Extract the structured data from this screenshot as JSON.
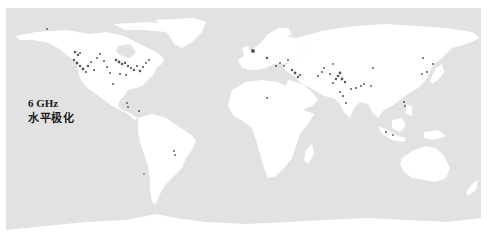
{
  "map": {
    "projection": "equirectangular",
    "ocean_color": "#e2e2e2",
    "land_color": "#ffffff",
    "point_color": "#3a3a3a",
    "label": {
      "frequency": "6 GHz",
      "polarization": "水平极化"
    },
    "rfi_points": [
      {
        "region": "north-america",
        "x": 75,
        "y": 52,
        "r": 1.3
      },
      {
        "region": "north-america",
        "x": 78,
        "y": 55,
        "r": 1.2
      },
      {
        "region": "north-america",
        "x": 80,
        "y": 53,
        "r": 1.1
      },
      {
        "region": "north-america",
        "x": 74,
        "y": 60,
        "r": 1.2
      },
      {
        "region": "north-america",
        "x": 77,
        "y": 63,
        "r": 1.4
      },
      {
        "region": "north-america",
        "x": 80,
        "y": 66,
        "r": 1.2
      },
      {
        "region": "north-america",
        "x": 83,
        "y": 69,
        "r": 1.4
      },
      {
        "region": "north-america",
        "x": 86,
        "y": 72,
        "r": 1.1
      },
      {
        "region": "north-america",
        "x": 88,
        "y": 66,
        "r": 1.2
      },
      {
        "region": "north-america",
        "x": 91,
        "y": 62,
        "r": 1.0
      },
      {
        "region": "north-america",
        "x": 94,
        "y": 70,
        "r": 1.1
      },
      {
        "region": "north-america",
        "x": 97,
        "y": 58,
        "r": 1.0
      },
      {
        "region": "north-america",
        "x": 100,
        "y": 54,
        "r": 1.1
      },
      {
        "region": "north-america",
        "x": 104,
        "y": 61,
        "r": 1.0
      },
      {
        "region": "north-america",
        "x": 107,
        "y": 67,
        "r": 1.0
      },
      {
        "region": "north-america",
        "x": 110,
        "y": 73,
        "r": 1.0
      },
      {
        "region": "north-america",
        "x": 113,
        "y": 84,
        "r": 1.0
      },
      {
        "region": "north-america",
        "x": 116,
        "y": 60,
        "r": 1.3
      },
      {
        "region": "north-america",
        "x": 119,
        "y": 62,
        "r": 1.4
      },
      {
        "region": "north-america",
        "x": 122,
        "y": 64,
        "r": 1.3
      },
      {
        "region": "north-america",
        "x": 125,
        "y": 63,
        "r": 1.2
      },
      {
        "region": "north-america",
        "x": 128,
        "y": 66,
        "r": 1.2
      },
      {
        "region": "north-america",
        "x": 131,
        "y": 68,
        "r": 1.1
      },
      {
        "region": "north-america",
        "x": 134,
        "y": 70,
        "r": 1.2
      },
      {
        "region": "north-america",
        "x": 137,
        "y": 66,
        "r": 1.1
      },
      {
        "region": "north-america",
        "x": 140,
        "y": 71,
        "r": 1.3
      },
      {
        "region": "north-america",
        "x": 143,
        "y": 67,
        "r": 1.1
      },
      {
        "region": "north-america",
        "x": 146,
        "y": 63,
        "r": 1.0
      },
      {
        "region": "north-america",
        "x": 149,
        "y": 60,
        "r": 1.0
      },
      {
        "region": "north-america",
        "x": 120,
        "y": 74,
        "r": 1.0
      },
      {
        "region": "north-america",
        "x": 126,
        "y": 75,
        "r": 1.0
      },
      {
        "region": "north-america",
        "x": 47,
        "y": 29,
        "r": 0.9
      },
      {
        "region": "central-america",
        "x": 127,
        "y": 103,
        "r": 0.9
      },
      {
        "region": "central-america",
        "x": 128,
        "y": 107,
        "r": 0.9
      },
      {
        "region": "south-america",
        "x": 139,
        "y": 111,
        "r": 1.0
      },
      {
        "region": "south-america",
        "x": 174,
        "y": 151,
        "r": 0.9
      },
      {
        "region": "south-america",
        "x": 175,
        "y": 155,
        "r": 0.9
      },
      {
        "region": "south-america",
        "x": 144,
        "y": 174,
        "r": 0.8
      },
      {
        "region": "europe",
        "x": 253,
        "y": 51,
        "r": 2.0
      },
      {
        "region": "europe",
        "x": 267,
        "y": 58,
        "r": 1.2
      },
      {
        "region": "middle-east",
        "x": 276,
        "y": 66,
        "r": 1.0
      },
      {
        "region": "middle-east",
        "x": 280,
        "y": 63,
        "r": 1.0
      },
      {
        "region": "middle-east",
        "x": 284,
        "y": 66,
        "r": 0.9
      },
      {
        "region": "middle-east",
        "x": 288,
        "y": 60,
        "r": 0.9
      },
      {
        "region": "middle-east",
        "x": 292,
        "y": 70,
        "r": 1.2
      },
      {
        "region": "middle-east",
        "x": 295,
        "y": 73,
        "r": 1.4
      },
      {
        "region": "middle-east",
        "x": 298,
        "y": 77,
        "r": 1.2
      },
      {
        "region": "middle-east",
        "x": 300,
        "y": 75,
        "r": 1.1
      },
      {
        "region": "africa",
        "x": 267,
        "y": 98,
        "r": 1.0
      },
      {
        "region": "south-asia",
        "x": 318,
        "y": 76,
        "r": 1.0
      },
      {
        "region": "south-asia",
        "x": 322,
        "y": 72,
        "r": 1.0
      },
      {
        "region": "south-asia",
        "x": 324,
        "y": 68,
        "r": 1.0
      },
      {
        "region": "south-asia",
        "x": 330,
        "y": 74,
        "r": 1.0
      },
      {
        "region": "south-asia",
        "x": 333,
        "y": 64,
        "r": 0.9
      },
      {
        "region": "south-asia",
        "x": 336,
        "y": 79,
        "r": 1.2
      },
      {
        "region": "south-asia",
        "x": 338,
        "y": 76,
        "r": 1.3
      },
      {
        "region": "south-asia",
        "x": 340,
        "y": 73,
        "r": 1.4
      },
      {
        "region": "south-asia",
        "x": 342,
        "y": 79,
        "r": 1.4
      },
      {
        "region": "south-asia",
        "x": 345,
        "y": 82,
        "r": 1.2
      },
      {
        "region": "south-asia",
        "x": 333,
        "y": 83,
        "r": 1.0
      },
      {
        "region": "south-asia",
        "x": 340,
        "y": 92,
        "r": 1.0
      },
      {
        "region": "south-asia",
        "x": 343,
        "y": 96,
        "r": 1.0
      },
      {
        "region": "south-asia",
        "x": 346,
        "y": 103,
        "r": 1.0
      },
      {
        "region": "south-asia",
        "x": 351,
        "y": 89,
        "r": 1.0
      },
      {
        "region": "south-asia",
        "x": 356,
        "y": 88,
        "r": 1.0
      },
      {
        "region": "south-asia",
        "x": 361,
        "y": 86,
        "r": 1.0
      },
      {
        "region": "south-asia",
        "x": 364,
        "y": 84,
        "r": 1.0
      },
      {
        "region": "south-asia",
        "x": 373,
        "y": 68,
        "r": 0.9
      },
      {
        "region": "south-asia",
        "x": 371,
        "y": 86,
        "r": 0.9
      },
      {
        "region": "east-asia",
        "x": 423,
        "y": 58,
        "r": 1.0
      },
      {
        "region": "east-asia",
        "x": 433,
        "y": 64,
        "r": 1.0
      },
      {
        "region": "east-asia",
        "x": 427,
        "y": 72,
        "r": 1.0
      },
      {
        "region": "east-asia",
        "x": 422,
        "y": 74,
        "r": 0.9
      },
      {
        "region": "east-asia",
        "x": 404,
        "y": 102,
        "r": 1.0
      },
      {
        "region": "east-asia",
        "x": 405,
        "y": 106,
        "r": 0.9
      },
      {
        "region": "southeast-asia",
        "x": 386,
        "y": 132,
        "r": 1.0
      },
      {
        "region": "southeast-asia",
        "x": 393,
        "y": 135,
        "r": 0.9
      }
    ]
  }
}
